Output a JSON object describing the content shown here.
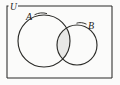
{
  "figure": {
    "type": "venn-diagram",
    "background_color": "#fbfbfa",
    "stroke_color": "#2b2b28",
    "shade_color": "#e8e8e6",
    "labels": {
      "universe": "U",
      "set_a": "A",
      "set_b": "B"
    },
    "universe_rect": {
      "name": "universal-set-rectangle",
      "x": 7,
      "y": 6,
      "width": 105,
      "height": 72,
      "top_border_gap_start": 8,
      "top_border_gap_end": 18
    },
    "circles": [
      {
        "name": "set-a-circle",
        "label": "A",
        "cx": 44,
        "cy": 41,
        "r": 26
      },
      {
        "name": "set-b-circle",
        "label": "B",
        "cx": 77,
        "cy": 45,
        "r": 20
      }
    ],
    "shaded_region": {
      "name": "intersection-region",
      "description": "A intersect B",
      "filled": true,
      "fill": "#e8e8e6"
    },
    "label_positions": {
      "universe": {
        "x": 10,
        "y": 9.5
      },
      "set_a": {
        "x": 26,
        "y": 20
      },
      "set_b": {
        "x": 88,
        "y": 29
      }
    },
    "leader_lines": [
      {
        "name": "leader-line-a",
        "from_label": "A",
        "path": "M 34.5 14.8 C 38.5 12.6 43 12.4 47 13.6"
      },
      {
        "name": "leader-line-b",
        "from_label": "B",
        "path": "M 86.5 24.2 C 83 22.4 79.5 22.2 76.5 23.2"
      }
    ]
  }
}
